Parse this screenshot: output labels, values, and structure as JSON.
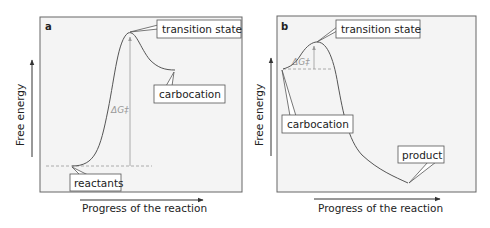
{
  "panels": [
    {
      "id": "a",
      "letter": "a",
      "y_axis_label": "Free energy",
      "x_axis_label": "Progress of the reaction",
      "callouts": {
        "transition_state": "transition state",
        "product": "carbocation",
        "reactant": "reactants"
      },
      "barrier_label": "ΔG‡"
    },
    {
      "id": "b",
      "letter": "b",
      "y_axis_label": "Free energy",
      "x_axis_label": "Progress of the reaction",
      "callouts": {
        "transition_state": "transition state",
        "reactant": "carbocation",
        "product": "product"
      },
      "barrier_label": "ΔG‡"
    }
  ],
  "colors": {
    "curve": "#555555",
    "frame": "#666666",
    "panel_bg": "#f4f4f4",
    "barrier_arrow": "#999999",
    "dashed": "#999999"
  }
}
